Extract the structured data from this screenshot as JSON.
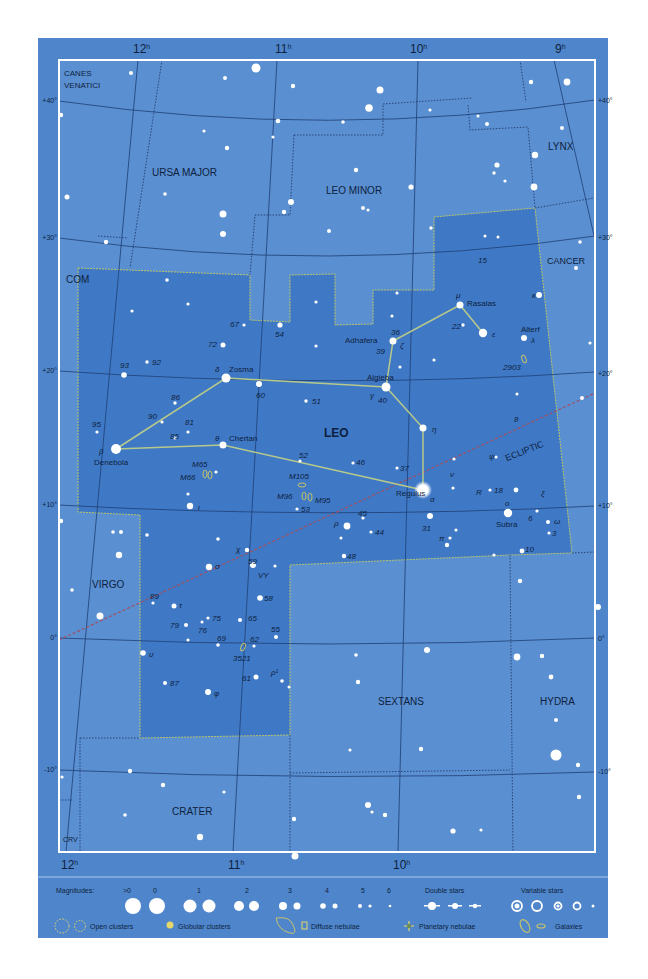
{
  "axes": {
    "ra_top": [
      {
        "label": "12",
        "sup": "h",
        "x": 143
      },
      {
        "label": "11",
        "sup": "h",
        "x": 280
      },
      {
        "label": "10",
        "sup": "h",
        "x": 420
      },
      {
        "label": "9",
        "sup": "h",
        "x": 558
      }
    ],
    "ra_bottom": [
      {
        "label": "12",
        "sup": "h",
        "x": 66
      },
      {
        "label": "11",
        "sup": "h",
        "x": 233
      },
      {
        "label": "10",
        "sup": "h",
        "x": 398
      }
    ],
    "dec_left": [
      {
        "label": "+40°",
        "y": 100
      },
      {
        "label": "+30°",
        "y": 237
      },
      {
        "label": "+20°",
        "y": 370
      },
      {
        "label": "+10°",
        "y": 505
      },
      {
        "label": "0°",
        "y": 638
      },
      {
        "label": "-10°",
        "y": 770
      }
    ],
    "dec_right": [
      {
        "label": "+40°",
        "y": 100
      },
      {
        "label": "+30°",
        "y": 237
      },
      {
        "label": "+20°",
        "y": 373
      },
      {
        "label": "+10°",
        "y": 505
      },
      {
        "label": "0°",
        "y": 638
      },
      {
        "label": "-10°",
        "y": 772
      }
    ]
  },
  "constellations": [
    {
      "name": "CANES",
      "x": 64,
      "y": 75
    },
    {
      "name": "VENATICI",
      "x": 64,
      "y": 87
    },
    {
      "name": "URSA MAJOR",
      "x": 152,
      "y": 176
    },
    {
      "name": "LEO MINOR",
      "x": 326,
      "y": 194
    },
    {
      "name": "LYNX",
      "x": 548,
      "y": 150
    },
    {
      "name": "CANCER",
      "x": 548,
      "y": 263
    },
    {
      "name": "COM",
      "x": 66,
      "y": 283
    },
    {
      "name": "LEO",
      "x": 324,
      "y": 437
    },
    {
      "name": "VIRGO",
      "x": 92,
      "y": 588
    },
    {
      "name": "SEXTANS",
      "x": 378,
      "y": 705
    },
    {
      "name": "HYDRA",
      "x": 540,
      "y": 705
    },
    {
      "name": "CRATER",
      "x": 172,
      "y": 815
    },
    {
      "name": "CRV",
      "x": 63,
      "y": 842
    }
  ],
  "named_stars": [
    {
      "name": "Regulus",
      "greek": "α",
      "x": 423,
      "y": 490
    },
    {
      "name": "Denebola",
      "greek": "β",
      "x": 116,
      "y": 449
    },
    {
      "name": "Algieba",
      "greek": "γ",
      "x": 386,
      "y": 387
    },
    {
      "name": "Zosma",
      "greek": "δ",
      "x": 226,
      "y": 378
    },
    {
      "name": "Chertan",
      "greek": "θ",
      "x": 223,
      "y": 445
    },
    {
      "name": "Adhafera",
      "greek": "ζ",
      "x": 393,
      "y": 341
    },
    {
      "name": "Rasalas",
      "greek": "μ",
      "x": 460,
      "y": 305
    },
    {
      "name": "Alterf",
      "greek": "λ",
      "x": 524,
      "y": 338
    },
    {
      "name": "Subra",
      "greek": "ο",
      "x": 508,
      "y": 513
    }
  ],
  "star_labels": [
    "15",
    "22",
    "36",
    "39",
    "40",
    "51",
    "52",
    "54",
    "60",
    "67",
    "72",
    "81",
    "85",
    "86",
    "90",
    "92",
    "93",
    "95",
    "46",
    "37",
    "45",
    "44",
    "48",
    "53",
    "31",
    "18",
    "8",
    "6",
    "3",
    "10",
    "59",
    "58",
    "55",
    "62",
    "61",
    "65",
    "69",
    "75",
    "76",
    "79",
    "87",
    "89",
    "VY",
    "R",
    "ε",
    "η",
    "ν",
    "ψ",
    "ξ",
    "ω",
    "π",
    "ρ",
    "ι",
    "σ",
    "χ",
    "τ",
    "υ",
    "φ",
    "κ",
    "ρ¹"
  ],
  "deep_sky": [
    {
      "id": "M65",
      "x": 195,
      "y": 464
    },
    {
      "id": "M66",
      "x": 183,
      "y": 478
    },
    {
      "id": "M105",
      "x": 303,
      "y": 476
    },
    {
      "id": "M96",
      "x": 284,
      "y": 498
    },
    {
      "id": "M95",
      "x": 316,
      "y": 499
    },
    {
      "id": "2903",
      "x": 512,
      "y": 367
    },
    {
      "id": "3521",
      "x": 245,
      "y": 659
    }
  ],
  "ecliptic_label": "ECLIPTIC",
  "legend": {
    "magnitudes_label": "Magnitudes:",
    "magnitude_values": [
      ">0",
      "0",
      "1",
      "2",
      "3",
      "4",
      "5",
      "6"
    ],
    "double_stars": "Double stars",
    "variable_stars": "Variable stars",
    "open_clusters": "Open clusters",
    "globular_clusters": "Globular clusters",
    "diffuse_nebulae": "Diffuse nebulae",
    "planetary_nebulae": "Planetary nebulae",
    "galaxies": "Galaxies"
  },
  "colors": {
    "background": "#4f86cb",
    "inner_sky": "#5a8fd1",
    "leo_region": "#3f79c6",
    "grid_line": "#1e3f75",
    "boundary": "#1a3465",
    "leo_boundary": "#b9c56a",
    "stick_figure": "#b7c98a",
    "ecliptic": "#a24e5e",
    "label": "#0e1f3e",
    "star": "#ffffff"
  }
}
